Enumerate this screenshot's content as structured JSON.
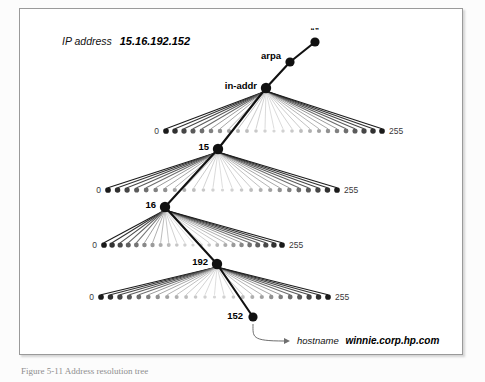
{
  "figure": {
    "annotation_prefix": "IP address",
    "annotation_value": "15.16.192.152",
    "root_label": "“”",
    "caption": "Figure 5-11   Address resolution tree",
    "callout_prefix": "hostname",
    "callout_value": "winnie.corp.hp.com",
    "range_min_label": "0",
    "range_max_label": "255"
  },
  "colors": {
    "node_fill": "#111111",
    "spine": "#111111",
    "fan_dark": "#222222",
    "fan_light": "#d4d4d4",
    "frame_border": "#9a9a9a",
    "background": "#ffffff",
    "callout_line": "#6f6f6f",
    "end_label": "#3a3a3a"
  },
  "spine": {
    "nodes": [
      {
        "name": "root",
        "label": "“”",
        "x": 315,
        "y": 42,
        "label_dx": 0,
        "label_dy": -9,
        "anchor": "middle",
        "radius": 4.6
      },
      {
        "name": "arpa",
        "label": "arpa",
        "x": 290,
        "y": 62,
        "label_dx": -9,
        "label_dy": -3,
        "anchor": "end",
        "radius": 4.6
      },
      {
        "name": "in-addr",
        "label": "in-addr",
        "x": 266,
        "y": 88,
        "label_dx": -9,
        "label_dy": 1,
        "anchor": "end",
        "radius": 5.2
      },
      {
        "name": "15",
        "label": "15",
        "x": 218,
        "y": 149,
        "label_dx": -9,
        "label_dy": 1,
        "anchor": "end",
        "radius": 5.2
      },
      {
        "name": "16",
        "label": "16",
        "x": 165,
        "y": 207,
        "label_dx": -9,
        "label_dy": 1,
        "anchor": "end",
        "radius": 5.2
      },
      {
        "name": "192",
        "label": "192",
        "x": 217,
        "y": 264,
        "label_dx": -9,
        "label_dy": 1,
        "anchor": "end",
        "radius": 5.2
      },
      {
        "name": "152",
        "label": "152",
        "x": 253,
        "y": 317,
        "label_dx": -10,
        "label_dy": 2,
        "anchor": "end",
        "radius": 4.6
      }
    ]
  },
  "chart_data": {
    "type": "diagram",
    "levels": [
      {
        "parent": "in-addr",
        "parent_x": 266,
        "parent_y": 88,
        "row_y": 131,
        "x_left": 166,
        "x_right": 382,
        "dots": 25,
        "selected_index": 5,
        "selected_label": "15"
      },
      {
        "parent": "15",
        "parent_x": 218,
        "parent_y": 149,
        "row_y": 190,
        "x_left": 108,
        "x_right": 337,
        "dots": 25,
        "selected_index": 5,
        "selected_label": "16"
      },
      {
        "parent": "16",
        "parent_x": 165,
        "parent_y": 207,
        "row_y": 245,
        "x_left": 104,
        "x_right": 282,
        "dots": 23,
        "selected_index": 15,
        "selected_label": "192"
      },
      {
        "parent": "192",
        "parent_x": 217,
        "parent_y": 264,
        "row_y": 297,
        "x_left": 101,
        "x_right": 328,
        "dots": 25,
        "selected_index": 15,
        "selected_label": "152"
      }
    ]
  },
  "callout": {
    "start_x": 253,
    "start_y": 324,
    "end_x": 290,
    "end_y": 341,
    "text_x": 297,
    "text_y": 344
  },
  "annotation": {
    "x": 62,
    "y": 45
  }
}
